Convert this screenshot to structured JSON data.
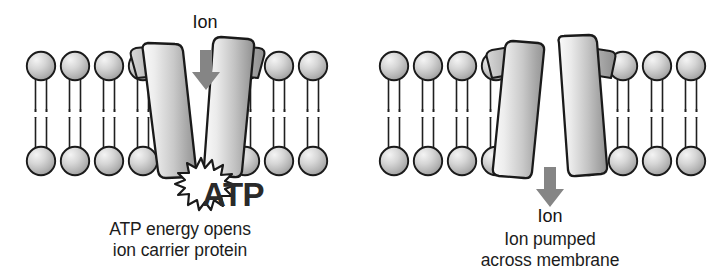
{
  "figure": {
    "title_alt": "Active transport of an ion across a cell membrane by an ATP-powered ion carrier protein",
    "background_color": "#ffffff"
  },
  "panels": [
    {
      "id": "left",
      "name": "atp-opens-carrier",
      "ion_label": "Ion",
      "ion_label_position": "above-membrane",
      "arrow": {
        "name": "ion-arrow-down",
        "direction": "down",
        "color": "#858585"
      },
      "energy_burst": {
        "name": "atp-burst",
        "label": "ATP",
        "burst_fill": "#ffffff",
        "burst_stroke": "#1a1a1a",
        "text_color": "#2a2a2a"
      },
      "protein": {
        "name": "ion-carrier-protein-open",
        "state": "open",
        "shape": "V-shaped, splayed open at top",
        "subunits": 2
      },
      "lipids_left": 4,
      "lipids_right": 3,
      "caption_line1": "ATP energy opens",
      "caption_line2": "ion carrier protein"
    },
    {
      "id": "right",
      "name": "ion-pumped-across",
      "ion_label": "Ion",
      "ion_label_position": "below-membrane",
      "arrow": {
        "name": "ion-arrow-down",
        "direction": "down",
        "color": "#858585"
      },
      "protein": {
        "name": "ion-carrier-protein-closed",
        "state": "closed-at-top",
        "shape": "inverted-V, splayed open at bottom",
        "subunits": 2
      },
      "lipids_left": 4,
      "lipids_right": 4,
      "caption_line1": "Ion pumped",
      "caption_line2": "across membrane"
    }
  ],
  "colors": {
    "outline": "#1a1a1a",
    "lipid_head_light": "#f2f2f2",
    "lipid_head_mid": "#c3c3c3",
    "lipid_head_dark": "#9a9a9a",
    "protein_light": "#f0f0f0",
    "protein_mid": "#bdbdbd",
    "protein_dark": "#8d8d8d",
    "arrow_gray": "#858585",
    "text": "#1c1c1c",
    "background": "#ffffff"
  },
  "membrane": {
    "name": "phospholipid-bilayer",
    "leaflets": 2,
    "head_shape": "circle",
    "tails_per_lipid": 2,
    "midline_gap": true
  }
}
